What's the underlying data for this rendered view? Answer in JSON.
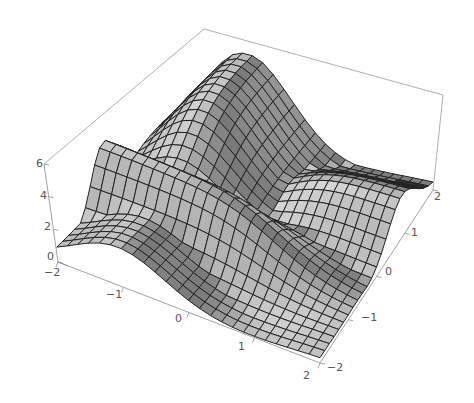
{
  "chart_data": {
    "type": "surface3d",
    "title": "",
    "xlabel": "",
    "ylabel": "",
    "zlabel": "",
    "x_range": [
      -2,
      2
    ],
    "y_range": [
      -2,
      2
    ],
    "z_range": [
      0,
      6
    ],
    "x_ticks": [
      "-2",
      "-1",
      "0",
      "1",
      "2"
    ],
    "y_ticks": [
      "-2",
      "-1",
      "0",
      "1",
      "2"
    ],
    "z_ticks": [
      "0",
      "2",
      "4",
      "6"
    ],
    "mesh_divisions": 24,
    "surface_color": "#b4b4b4",
    "mesh_color": "#222222",
    "box_color": "#9a9a9a",
    "shape_notes": "Surface with a tall ridge at the back (peak ~6 near x=-1,y=2), a front-left ridge near y=-1..0 rising ~4.5, low basin near center-right, dark shaded fold near x=2,y=1.5"
  },
  "labels": {
    "z": [
      {
        "text": "6",
        "x": 36,
        "y": 167
      },
      {
        "text": "4",
        "x": 40,
        "y": 199
      },
      {
        "text": "2",
        "x": 44,
        "y": 230
      },
      {
        "text": "0",
        "x": 47,
        "y": 260
      }
    ],
    "xfront": [
      {
        "text": "-2",
        "x": 44,
        "y": 276
      },
      {
        "text": "-1",
        "x": 106,
        "y": 298
      },
      {
        "text": "0",
        "x": 175,
        "y": 322
      },
      {
        "text": "1",
        "x": 238,
        "y": 350
      },
      {
        "text": "2",
        "x": 303,
        "y": 379
      }
    ],
    "yright": [
      {
        "text": "-2",
        "x": 327,
        "y": 371
      },
      {
        "text": "-1",
        "x": 361,
        "y": 321
      },
      {
        "text": "0",
        "x": 385,
        "y": 275
      },
      {
        "text": "1",
        "x": 411,
        "y": 236
      },
      {
        "text": "2",
        "x": 434,
        "y": 200
      }
    ]
  }
}
